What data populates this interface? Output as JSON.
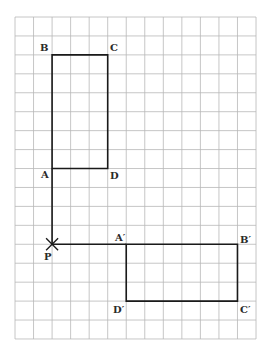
{
  "diagram": {
    "type": "rotation-on-grid",
    "grid": {
      "left": 15,
      "top": 17,
      "columns": 13,
      "rows": 17,
      "cell_w": 18.54,
      "cell_h": 18.94,
      "line_color": "#b8b8b8"
    },
    "shape_color": "#1a1a1a",
    "original": {
      "name": "ABCD",
      "vertices": {
        "A": {
          "col": 2,
          "row": 8
        },
        "B": {
          "col": 2,
          "row": 2
        },
        "C": {
          "col": 5,
          "row": 2
        },
        "D": {
          "col": 5,
          "row": 8
        }
      }
    },
    "image": {
      "name": "A'B'C'D'",
      "vertices": {
        "A'": {
          "col": 6,
          "row": 12
        },
        "B'": {
          "col": 12,
          "row": 12
        },
        "C'": {
          "col": 12,
          "row": 15
        },
        "D'": {
          "col": 6,
          "row": 15
        }
      }
    },
    "center": {
      "name": "P",
      "col": 2,
      "row": 12
    },
    "connectors": [
      {
        "from": "A",
        "to": "P"
      },
      {
        "from": "P",
        "to": "A'"
      }
    ],
    "labels": {
      "A": "A",
      "B": "B",
      "C": "C",
      "D": "D",
      "A_prime": "A′",
      "B_prime": "B′",
      "C_prime": "C′",
      "D_prime": "D′",
      "P": "P"
    }
  }
}
